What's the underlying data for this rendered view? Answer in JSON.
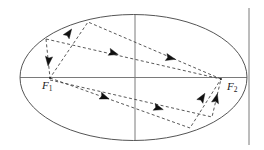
{
  "figure": {
    "kind": "ellipse-reflection-diagram",
    "canvas": {
      "width": 264,
      "height": 150,
      "background": "#ffffff"
    },
    "colors": {
      "ellipse_stroke": "#555555",
      "axis_stroke": "#7a7a7a",
      "ray_stroke": "#3a3a3a",
      "arrow_fill": "#111111",
      "label_color": "#1a1a1a"
    },
    "ellipse": {
      "name": "ellipse-outline",
      "cx": 133.5,
      "cy": 77.5,
      "rx": 113.5,
      "ry": 63.0,
      "stroke_width": 1.0
    },
    "axes": {
      "major_axis": {
        "name": "major-axis-line",
        "x1": 20,
        "y1": 77.5,
        "x2": 247,
        "y2": 77.5
      },
      "minor_axis": {
        "name": "minor-axis-line",
        "x1": 135,
        "y1": 15,
        "x2": 135,
        "y2": 140
      },
      "right_vertical": {
        "name": "right-vertical-line",
        "x1": 249,
        "y1": 8,
        "x2": 249,
        "y2": 145
      }
    },
    "foci": [
      {
        "name": "focus-f1",
        "id": "F1",
        "label": "F",
        "subscript": "1",
        "x": 50,
        "y": 78
      },
      {
        "name": "focus-f2",
        "id": "F2",
        "label": "F",
        "subscript": "2",
        "x": 221,
        "y": 79
      }
    ],
    "reflection_points": [
      {
        "name": "reflection-point-upper-left",
        "x": 46,
        "y": 39
      },
      {
        "name": "reflection-point-top",
        "x": 88,
        "y": 22
      },
      {
        "name": "reflection-point-lower-right",
        "x": 190,
        "y": 128
      },
      {
        "name": "reflection-point-right-lower",
        "x": 212,
        "y": 117
      }
    ],
    "ray_paths": [
      {
        "name": "ray-path-upper",
        "dash": "3,2.4",
        "points": [
          {
            "x": 46,
            "y": 39
          },
          {
            "x": 50,
            "y": 78
          },
          {
            "x": 88,
            "y": 22
          },
          {
            "x": 221,
            "y": 79
          }
        ]
      },
      {
        "name": "ray-path-upper-secondary",
        "dash": "3,2.4",
        "points": [
          {
            "x": 46,
            "y": 39
          },
          {
            "x": 221,
            "y": 79
          }
        ]
      },
      {
        "name": "ray-path-lower",
        "dash": "3,2.4",
        "points": [
          {
            "x": 50,
            "y": 78
          },
          {
            "x": 190,
            "y": 128
          },
          {
            "x": 221,
            "y": 79
          }
        ]
      },
      {
        "name": "ray-path-lower-secondary",
        "dash": "3,2.4",
        "points": [
          {
            "x": 50,
            "y": 80
          },
          {
            "x": 212,
            "y": 117
          },
          {
            "x": 221,
            "y": 79
          }
        ]
      }
    ],
    "arrows": [
      {
        "name": "arrow-down-to-f1",
        "x": 48.6,
        "y": 60.5,
        "angle": 96
      },
      {
        "name": "arrow-up-right-to-top",
        "x": 68.5,
        "y": 33.5,
        "angle": -55
      },
      {
        "name": "arrow-right-upper-inner",
        "x": 113,
        "y": 53,
        "angle": 17
      },
      {
        "name": "arrow-right-upper-outer",
        "x": 170,
        "y": 58,
        "angle": 13
      },
      {
        "name": "arrow-right-lower-inner",
        "x": 104,
        "y": 97,
        "angle": 20
      },
      {
        "name": "arrow-right-lower-outer",
        "x": 158,
        "y": 108,
        "angle": 17
      },
      {
        "name": "arrow-up-to-f2-inner",
        "x": 202,
        "y": 98,
        "angle": -58
      },
      {
        "name": "arrow-up-to-f2-outer",
        "x": 216,
        "y": 99,
        "angle": -76
      }
    ]
  }
}
